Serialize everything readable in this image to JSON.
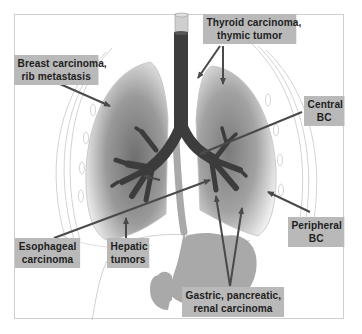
{
  "diagram": {
    "type": "anatomical-illustration",
    "colors": {
      "background": "#ffffff",
      "frame": "#cfcfcf",
      "label_box": "#b9b9b9",
      "label_text": "#1e1e1e",
      "airway": "#3c3c3c",
      "lung_shade": "#8a8a8a",
      "esophagus_stomach": "#a9a9a9",
      "arrow": "#4a4a4a"
    },
    "labels": {
      "breast": {
        "line1": "Breast carcinoma,",
        "line2": "rib metastasis"
      },
      "thyroid": {
        "line1": "Thyroid carcinoma,",
        "line2": "thymic tumor"
      },
      "central": {
        "line1": "Central",
        "line2": "BC"
      },
      "peripheral": {
        "line1": "Peripheral",
        "line2": "BC"
      },
      "esophageal": {
        "line1": "Esophageal",
        "line2": "carcinoma"
      },
      "hepatic": {
        "line1": "Hepatic",
        "line2": "tumors"
      },
      "gastric": {
        "line1": "Gastric, pancreatic,",
        "line2": "renal carcinoma"
      }
    },
    "structures": [
      "trachea",
      "bronchial tree",
      "left lung",
      "right lung",
      "ribs",
      "esophagus",
      "stomach",
      "liver outline"
    ]
  }
}
